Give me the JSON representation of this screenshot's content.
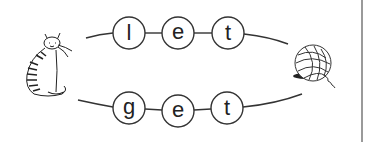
{
  "worksheet": {
    "top_word": {
      "letters": [
        "l",
        "e",
        "t"
      ]
    },
    "bottom_word": {
      "letters": [
        "g",
        "e",
        "t"
      ]
    },
    "left_picture": "cat-icon",
    "right_picture": "yarn-ball-icon",
    "colors": {
      "ink": "#222222",
      "background": "#ffffff",
      "rule": "#9a9a9a"
    }
  }
}
